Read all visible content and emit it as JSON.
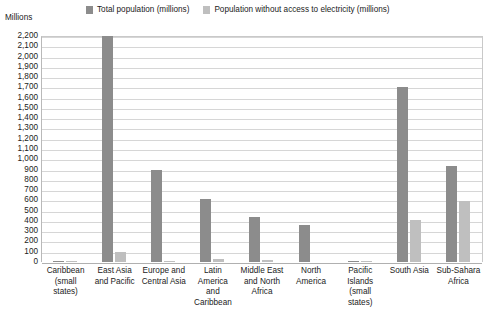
{
  "axis_title": "Millions",
  "legend": [
    {
      "label": "Total population (millions)",
      "color": "#8c8c8c"
    },
    {
      "label": "Population without access to electricity (millions)",
      "color": "#bfbfbf"
    }
  ],
  "chart_data": {
    "type": "bar",
    "title": "",
    "xlabel": "",
    "ylabel": "Millions",
    "ylim": [
      0,
      2200
    ],
    "ytick_step": 100,
    "grid": true,
    "legend_position": "top",
    "categories": [
      "Caribbean (small states)",
      "East Asia and Pacific",
      "Europe and Central Asia",
      "Latin America and Caribbean",
      "Middle East and North Africa",
      "North America",
      "Pacific Islands (small states)",
      "South Asia",
      "Sub-Sahara Africa"
    ],
    "tick_labels": [
      "2,200",
      "2,100",
      "2,000",
      "1,900",
      "1,800",
      "1,700",
      "1,600",
      "1,500",
      "1,400",
      "1,300",
      "1,200",
      "1,100",
      "1,000",
      "900",
      "800",
      "700",
      "600",
      "500",
      "400",
      "300",
      "200",
      "100",
      "0"
    ],
    "series": [
      {
        "name": "Total population (millions)",
        "color": "#8c8c8c",
        "values": [
          7,
          2200,
          900,
          615,
          440,
          360,
          2,
          1700,
          930
        ]
      },
      {
        "name": "Population without access to electricity (millions)",
        "color": "#bfbfbf",
        "values": [
          1,
          100,
          2,
          25,
          20,
          0,
          1,
          410,
          590
        ]
      }
    ]
  },
  "category_label_lines": [
    [
      "Caribbean",
      "(small",
      "states)"
    ],
    [
      "East Asia",
      "and Pacific"
    ],
    [
      "Europe and",
      "Central Asia"
    ],
    [
      "Latin",
      "America",
      "and",
      "Caribbean"
    ],
    [
      "Middle East",
      "and North",
      "Africa"
    ],
    [
      "North",
      "America"
    ],
    [
      "Pacific",
      "Islands",
      "(small",
      "states)"
    ],
    [
      "South Asia"
    ],
    [
      "Sub-Sahara",
      "Africa"
    ]
  ]
}
